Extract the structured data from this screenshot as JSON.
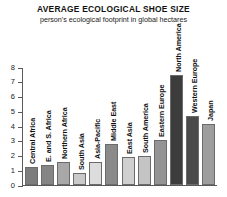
{
  "header": {
    "title": "AVERAGE ECOLOGICAL SHOE SIZE",
    "subtitle": "person's ecological footprint in global hectares"
  },
  "chart_data": {
    "type": "bar",
    "title": "AVERAGE ECOLOGICAL SHOE SIZE",
    "subtitle": "person's ecological footprint in global hectares",
    "xlabel": "",
    "ylabel": "",
    "ylim": [
      0,
      8
    ],
    "yticks": [
      0,
      1,
      2,
      3,
      4,
      5,
      6,
      7,
      8
    ],
    "ytick_labels": [
      "0",
      "1",
      "2",
      "3",
      "4",
      "5",
      "6",
      "7",
      "8"
    ],
    "grid": false,
    "legend": "none",
    "categories": [
      "Central Africa",
      "E. and S. Africa",
      "Northern Africa",
      "South Asia",
      "Asia-Pacific",
      "Middle East",
      "East Asia",
      "South America",
      "Eastern Europe",
      "North America",
      "Western Europe",
      "Japan"
    ],
    "values": [
      1.2,
      1.4,
      1.6,
      0.8,
      1.6,
      2.8,
      1.9,
      2.0,
      3.1,
      7.5,
      4.7,
      4.2
    ],
    "bar_colors": [
      "#7d7d7d",
      "#858585",
      "#a8a8a8",
      "#c9c9c9",
      "#dcdcdc",
      "#8a8a8a",
      "#cfcfcf",
      "#c4c4c4",
      "#949494",
      "#3c3c3c",
      "#4a4a4a",
      "#9d9d9d"
    ]
  },
  "colors": {
    "background": "#ffffff",
    "axis": "#5a5a5a",
    "text": "#1a1a1a"
  }
}
